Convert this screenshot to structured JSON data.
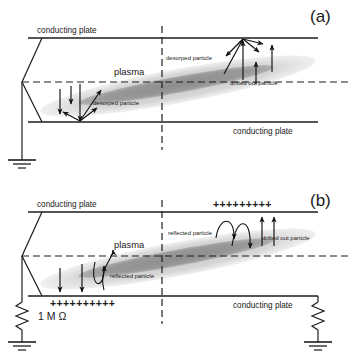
{
  "figure": {
    "title_not_shown": "",
    "background_color": "#ffffff",
    "ink_color": "#1d1d1d",
    "halo_color": "#c9c9c9",
    "core_color": "#8a8a8a"
  },
  "panels": [
    {
      "id": "a",
      "label": "(a)",
      "top_plate_label": "conducting plate",
      "bottom_plate_label": "conducting plate",
      "plasma_label": "plasma",
      "annotations": [
        {
          "key": "desorped_top",
          "text": "desorped particle"
        },
        {
          "key": "desorped_bottom",
          "text": "desorped particle"
        },
        {
          "key": "drifted_out",
          "text": "drifted out particle"
        }
      ],
      "charges": {
        "top": "",
        "bottom": ""
      },
      "left_circuit": {
        "type": "short-to-ground",
        "resistor_label": ""
      },
      "right_circuit": {
        "type": "none",
        "resistor_label": ""
      }
    },
    {
      "id": "b",
      "label": "(b)",
      "top_plate_label": "conducting plate",
      "bottom_plate_label": "conducting plate",
      "plasma_label": "plasma",
      "annotations": [
        {
          "key": "reflected_top",
          "text": "reflected particle"
        },
        {
          "key": "reflected_bottom",
          "text": "reflected particle"
        },
        {
          "key": "drifted_out",
          "text": "drifted out particle"
        }
      ],
      "charges": {
        "top": "+++++++++",
        "bottom": "++++++++++"
      },
      "left_circuit": {
        "type": "resistor-to-ground",
        "resistor_label": "1 M Ω"
      },
      "right_circuit": {
        "type": "resistor-to-ground",
        "resistor_label": ""
      }
    }
  ]
}
